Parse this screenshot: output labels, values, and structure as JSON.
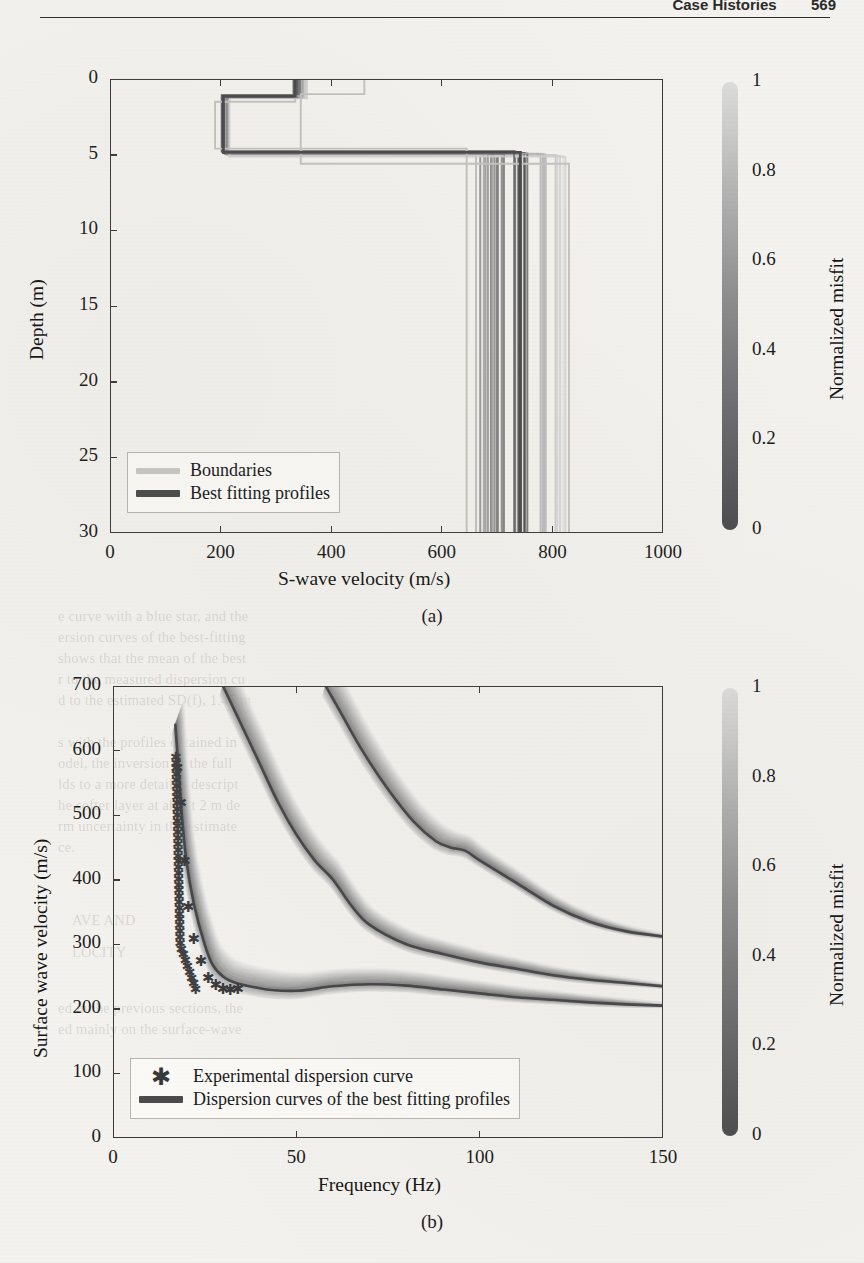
{
  "page": {
    "running_head": "Case Histories",
    "page_number": "569"
  },
  "bleed_through_text": [
    {
      "t": "e curve with a blue star, and the",
      "x": 58,
      "y": 608
    },
    {
      "t": "ersion curves of the best-fitting",
      "x": 58,
      "y": 629
    },
    {
      "t": "shows that the mean of the best",
      "x": 58,
      "y": 650
    },
    {
      "t": "r to the measured dispersion cu",
      "x": 58,
      "y": 671
    },
    {
      "t": "d to the estimated SD(f), 1.47 m",
      "x": 58,
      "y": 692
    },
    {
      "t": "s with the profiles obtained in",
      "x": 58,
      "y": 734
    },
    {
      "t": "odel, the inversion of the full",
      "x": 58,
      "y": 755
    },
    {
      "t": "lds to a more detailed descript",
      "x": 58,
      "y": 776
    },
    {
      "t": "he softer layer at about 2 m de",
      "x": 58,
      "y": 797
    },
    {
      "t": "rm uncertainty in the estimate",
      "x": 58,
      "y": 818
    },
    {
      "t": "ce.",
      "x": 58,
      "y": 839
    },
    {
      "t": "AVE AND",
      "x": 72,
      "y": 912
    },
    {
      "t": "LOCITY",
      "x": 72,
      "y": 944
    },
    {
      "t": "ed in the previous sections, the",
      "x": 58,
      "y": 1000
    },
    {
      "t": "ed mainly on the surface-wave",
      "x": 58,
      "y": 1021
    }
  ],
  "panel_a": {
    "caption": "(a)",
    "xlabel": "S-wave velocity (m/s)",
    "ylabel": "Depth (m)",
    "xticks": [
      "0",
      "200",
      "400",
      "600",
      "800",
      "1000"
    ],
    "yticks": [
      "0",
      "5",
      "10",
      "15",
      "20",
      "25",
      "30"
    ],
    "legend": [
      {
        "label": "Boundaries",
        "style": "light"
      },
      {
        "label": "Best fitting profiles",
        "style": "dark"
      }
    ],
    "colorbar": {
      "title": "Normalized misfit",
      "labels": [
        "1",
        "0.8",
        "0.6",
        "0.4",
        "0.2",
        "0"
      ]
    }
  },
  "panel_b": {
    "caption": "(b)",
    "xlabel": "Frequency (Hz)",
    "ylabel": "Surface wave velocity (m/s)",
    "xticks": [
      "0",
      "50",
      "100",
      "150"
    ],
    "yticks": [
      "0",
      "100",
      "200",
      "300",
      "400",
      "500",
      "600",
      "700"
    ],
    "legend": [
      {
        "label": "Experimental dispersion curve",
        "style": "star"
      },
      {
        "label": "Dispersion curves of the best fitting profiles",
        "style": "dark"
      }
    ],
    "colorbar": {
      "title": "Normalized misfit",
      "labels": [
        "1",
        "0.8",
        "0.6",
        "0.4",
        "0.2",
        "0"
      ]
    }
  },
  "colors": {
    "ink": "#1b1b1b",
    "axis": "#3a3a3a",
    "best_fit": "#4a4a4c",
    "boundaries": "#c9c7c2",
    "paper": "#f3f2ee",
    "cbar_low": "#4c4c4e",
    "cbar_high": "#dcdcda"
  },
  "chart_data": [
    {
      "type": "line",
      "id": "panel-a-vs-profiles",
      "title": "",
      "xlabel": "S-wave velocity (m/s)",
      "ylabel": "Depth (m)",
      "xlim": [
        0,
        1000
      ],
      "ylim": [
        30,
        0
      ],
      "y_inverted": true,
      "xticks": [
        0,
        200,
        400,
        600,
        800,
        1000
      ],
      "yticks": [
        0,
        5,
        10,
        15,
        20,
        25,
        30
      ],
      "grid": false,
      "legend_position": "lower-left",
      "colorbar": {
        "label": "Normalized misfit",
        "ticks": [
          0,
          0.2,
          0.4,
          0.6,
          0.8,
          1
        ],
        "vmin": 0,
        "vmax": 1
      },
      "series": [
        {
          "name": "Boundaries (upper/lower search limits)",
          "style": "light-gray step",
          "upper_bound_steps": [
            {
              "depth_top": 0.0,
              "depth_bottom": 1.0,
              "vs": 460
            },
            {
              "depth_top": 1.0,
              "depth_bottom": 5.6,
              "vs": 345
            },
            {
              "depth_top": 5.6,
              "depth_bottom": 30.0,
              "vs": 830
            }
          ],
          "lower_bound_steps": [
            {
              "depth_top": 0.0,
              "depth_bottom": 1.5,
              "vs": 335
            },
            {
              "depth_top": 1.5,
              "depth_bottom": 4.6,
              "vs": 190
            },
            {
              "depth_top": 4.6,
              "depth_bottom": 30.0,
              "vs": 645
            }
          ]
        },
        {
          "name": "Best fitting profiles (ensemble, shaded by misfit)",
          "style": "gray-to-dark step bundle",
          "profiles": [
            {
              "misfit": 0.05,
              "layers": [
                {
                  "depth_top": 0.0,
                  "depth_bottom": 1.15,
                  "vs": 335
                },
                {
                  "depth_top": 1.15,
                  "depth_bottom": 4.85,
                  "vs": 205
                },
                {
                  "depth_top": 4.85,
                  "depth_bottom": 30.0,
                  "vs": 742
                }
              ]
            },
            {
              "misfit": 0.25,
              "layers": [
                {
                  "depth_top": 0.0,
                  "depth_bottom": 1.15,
                  "vs": 340
                },
                {
                  "depth_top": 1.15,
                  "depth_bottom": 4.9,
                  "vs": 208
                },
                {
                  "depth_top": 4.9,
                  "depth_bottom": 30.0,
                  "vs": 700
                }
              ]
            },
            {
              "misfit": 0.45,
              "layers": [
                {
                  "depth_top": 0.0,
                  "depth_bottom": 1.2,
                  "vs": 345
                },
                {
                  "depth_top": 1.2,
                  "depth_bottom": 4.9,
                  "vs": 210
                },
                {
                  "depth_top": 4.9,
                  "depth_bottom": 30.0,
                  "vs": 672
                }
              ]
            },
            {
              "misfit": 0.7,
              "layers": [
                {
                  "depth_top": 0.0,
                  "depth_bottom": 1.2,
                  "vs": 350
                },
                {
                  "depth_top": 1.2,
                  "depth_bottom": 5.0,
                  "vs": 212
                },
                {
                  "depth_top": 5.0,
                  "depth_bottom": 30.0,
                  "vs": 790
                }
              ]
            },
            {
              "misfit": 0.9,
              "layers": [
                {
                  "depth_top": 0.0,
                  "depth_bottom": 1.25,
                  "vs": 355
                },
                {
                  "depth_top": 1.25,
                  "depth_bottom": 5.1,
                  "vs": 215
                },
                {
                  "depth_top": 5.1,
                  "depth_bottom": 30.0,
                  "vs": 818
                }
              ]
            }
          ],
          "halfspace_vs_range": [
            645,
            830
          ],
          "layer2_vs_range": [
            195,
            230
          ],
          "layer1_vs_range": [
            330,
            360
          ]
        }
      ]
    },
    {
      "type": "line",
      "id": "panel-b-dispersion",
      "title": "",
      "xlabel": "Frequency (Hz)",
      "ylabel": "Surface wave velocity (m/s)",
      "xlim": [
        0,
        150
      ],
      "ylim": [
        0,
        700
      ],
      "xticks": [
        0,
        50,
        100,
        150
      ],
      "yticks": [
        0,
        100,
        200,
        300,
        400,
        500,
        600,
        700
      ],
      "grid": false,
      "legend_position": "lower-left",
      "colorbar": {
        "label": "Normalized misfit",
        "ticks": [
          0,
          0.2,
          0.4,
          0.6,
          0.8,
          1
        ],
        "vmin": 0,
        "vmax": 1
      },
      "series": [
        {
          "name": "Experimental dispersion curve",
          "marker": "star",
          "x": [
            17.5,
            18.5,
            19.5,
            20.5,
            22,
            24,
            26,
            28,
            30,
            32,
            34
          ],
          "y": [
            575,
            520,
            430,
            360,
            310,
            275,
            250,
            238,
            232,
            230,
            232
          ]
        },
        {
          "name": "Mode 1 (fundamental) — best fitting profiles",
          "x": [
            17,
            20,
            25,
            30,
            40,
            50,
            60,
            70,
            80,
            90,
            100,
            110,
            120,
            130,
            140,
            150
          ],
          "y": [
            640,
            430,
            300,
            250,
            232,
            228,
            235,
            238,
            236,
            230,
            224,
            218,
            214,
            210,
            207,
            205
          ]
        },
        {
          "name": "Mode 2 — best fitting profiles",
          "x": [
            30,
            35,
            40,
            45,
            50,
            55,
            60,
            65,
            70,
            80,
            90,
            100,
            110,
            120,
            130,
            140,
            150
          ],
          "y": [
            700,
            640,
            580,
            520,
            470,
            430,
            400,
            360,
            330,
            300,
            285,
            272,
            262,
            252,
            245,
            240,
            235
          ]
        },
        {
          "name": "Mode 3 — best fitting profiles",
          "x": [
            58,
            62,
            68,
            75,
            82,
            88,
            92,
            96,
            100,
            110,
            120,
            130,
            140,
            150
          ],
          "y": [
            700,
            660,
            600,
            540,
            490,
            460,
            450,
            445,
            430,
            395,
            360,
            335,
            320,
            312
          ]
        }
      ]
    }
  ]
}
